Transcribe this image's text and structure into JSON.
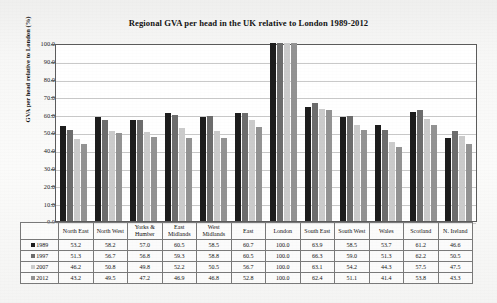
{
  "chart_data": {
    "type": "bar",
    "title": "Regional GVA per head in the UK relative to London 1989-2012",
    "xlabel": "",
    "ylabel": "GVA per head relative to London (%)",
    "ylim": [
      0.0,
      100.0
    ],
    "ytick_step": 10.0,
    "yticks": [
      "100.0",
      "90.0",
      "80.0",
      "70.0",
      "60.0",
      "50.0",
      "40.0",
      "30.0",
      "20.0",
      "10.0",
      "0.0"
    ],
    "grid": true,
    "legend_position": "table-row-headers",
    "categories": [
      "North East",
      "North West",
      "Yorks & Humber",
      "East Midlands",
      "West Midlands",
      "East",
      "London",
      "South East",
      "South West",
      "Wales",
      "Scotland",
      "N. Ireland"
    ],
    "series": [
      {
        "name": "1989",
        "color": "#1d1d1d",
        "values": [
          53.2,
          58.2,
          57.0,
          60.5,
          58.5,
          60.7,
          100.0,
          63.9,
          58.5,
          53.7,
          61.2,
          46.6
        ]
      },
      {
        "name": "1997",
        "color": "#6d6d6d",
        "values": [
          51.3,
          56.7,
          56.8,
          59.3,
          58.8,
          60.5,
          100.0,
          66.3,
          59.0,
          51.3,
          62.2,
          50.5
        ]
      },
      {
        "name": "2007",
        "color": "#cbcbcb",
        "values": [
          46.2,
          50.8,
          49.8,
          52.2,
          50.5,
          56.7,
          100.0,
          63.1,
          54.2,
          44.3,
          57.5,
          47.5
        ]
      },
      {
        "name": "2012",
        "color": "#939393",
        "values": [
          43.2,
          49.5,
          47.2,
          46.9,
          46.8,
          52.8,
          100.0,
          62.4,
          51.1,
          41.4,
          53.8,
          43.3
        ]
      }
    ]
  },
  "table": {
    "header_labels": [
      "North East",
      "North West",
      "Yorks & Humber",
      "East Midlands",
      "West Midlands",
      "East",
      "London",
      "South East",
      "South West",
      "Wales",
      "Scotland",
      "N. Ireland"
    ]
  }
}
